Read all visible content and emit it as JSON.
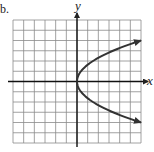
{
  "panel_label": "b.",
  "chart_data": {
    "type": "line",
    "title": "",
    "xlabel": "x",
    "ylabel": "y",
    "xlim": [
      -6,
      6
    ],
    "ylim": [
      -6,
      6
    ],
    "grid": true,
    "grid_step": 1,
    "series": [
      {
        "name": "sideways parabola x = 3y^2/8",
        "relation": "x = (3/8) y^2",
        "x": [
          6,
          3.375,
          1.5,
          0.375,
          0,
          0.375,
          1.5,
          3.375,
          6
        ],
        "y": [
          -4,
          -3,
          -2,
          -1,
          0,
          1,
          2,
          3,
          4
        ],
        "arrows_at_ends": true,
        "color": "#333333"
      }
    ]
  }
}
